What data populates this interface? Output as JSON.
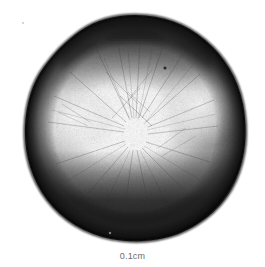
{
  "plate": {
    "background_color": "#ffffff",
    "width": 265,
    "height": 267,
    "caption_text": "0.1cm",
    "caption_color": "#6b6b6b"
  },
  "specimen": {
    "label": "specimen-micrograph",
    "description": "Rounded sub-triangular grayscale specimen with dark rim, dark apical cap, bright radiating center and dark lower margin",
    "outline_color": "#1c1c1c",
    "rim_color": "#1a1a1a",
    "highlight_color": "#ffffff",
    "shadow_color": "#2a2a2a",
    "midtone_color": "#6e6e6e",
    "center_x": 135,
    "center_y": 128,
    "width_px": 220,
    "height_px": 226,
    "top_y": 15,
    "bottom_y": 241,
    "left_x": 25,
    "right_x": 245
  },
  "scale_bar": {
    "value": "0.1cm",
    "units": "cm",
    "magnitude": "0.1"
  },
  "artifacts": {
    "speck_1": {
      "x": 22,
      "y": 22,
      "size": 2
    },
    "speck_2": {
      "x": 165,
      "y": 68,
      "size": 3
    },
    "speck_3": {
      "x": 110,
      "y": 233,
      "size": 2
    }
  }
}
